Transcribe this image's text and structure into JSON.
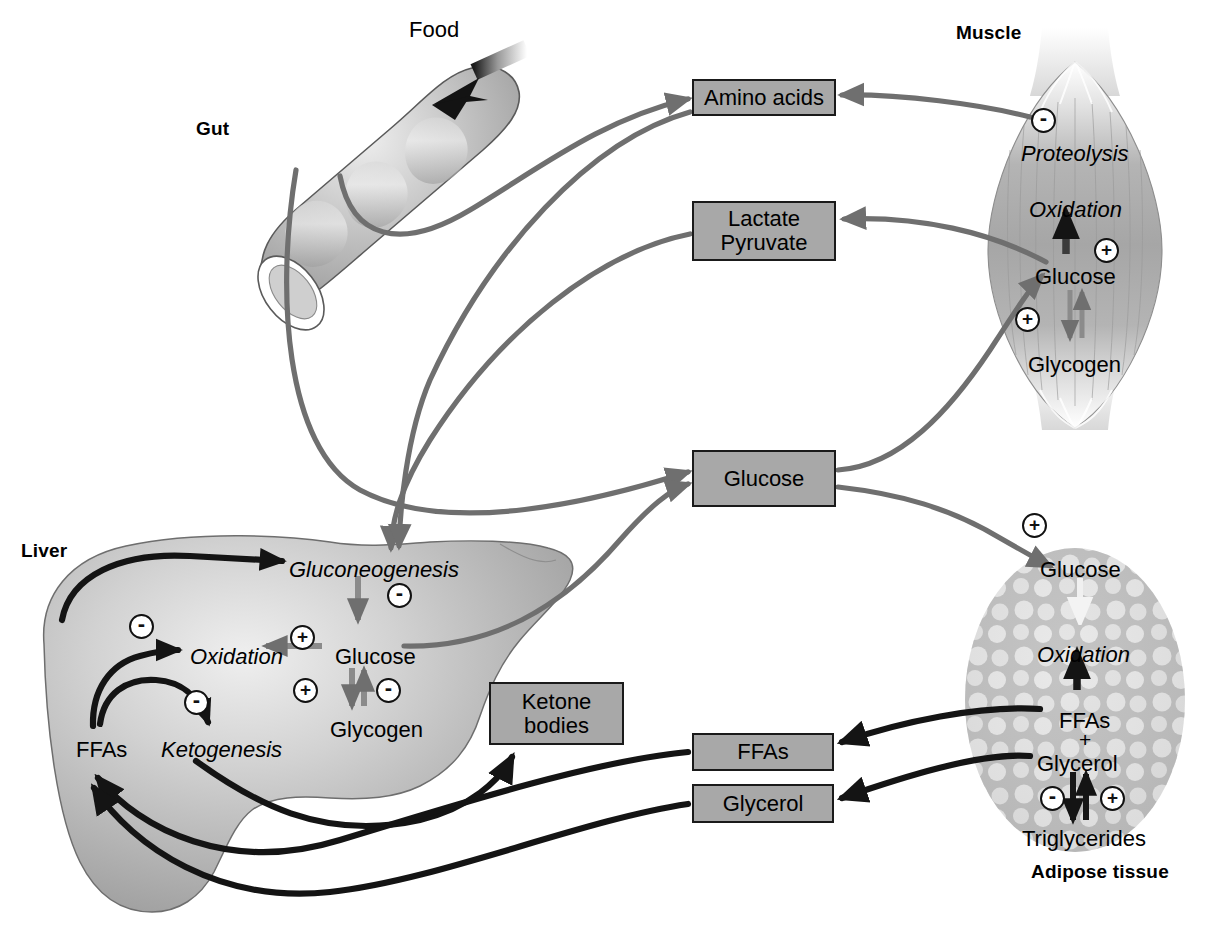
{
  "diagram": {
    "type": "physiology-flow-diagram",
    "background": "#ffffff"
  },
  "colors": {
    "box_fill": "#a8a8a8",
    "box_stroke": "#1a1a1a",
    "gray_arrow": "#6f6f6f",
    "black_arrow": "#141414",
    "organ_gray": "#b3b3b3",
    "text": "#000000"
  },
  "organs": {
    "gut": {
      "title": "Gut",
      "title_pos": [
        196,
        118
      ],
      "food_label": "Food",
      "food_label_pos": [
        409,
        18
      ]
    },
    "muscle": {
      "title": "Muscle",
      "title_pos": [
        956,
        22
      ],
      "items": [
        {
          "label": "Proteolysis",
          "style": "italic",
          "pos": [
            1021,
            142
          ]
        },
        {
          "label": "Oxidation",
          "style": "italic",
          "pos": [
            1029,
            198
          ]
        },
        {
          "label": "Glucose",
          "style": "plain",
          "pos": [
            1035,
            265
          ]
        },
        {
          "label": "Glycogen",
          "style": "plain",
          "pos": [
            1028,
            353
          ]
        }
      ],
      "signs": [
        {
          "sign": "-",
          "pos": [
            1031,
            108
          ],
          "target": "proteolysis"
        },
        {
          "sign": "+",
          "pos": [
            1094,
            238
          ],
          "target": "oxidation"
        },
        {
          "sign": "+",
          "pos": [
            1015,
            307
          ],
          "target": "glucose-uptake"
        }
      ]
    },
    "liver": {
      "title": "Liver",
      "title_pos": [
        21,
        540
      ],
      "items": [
        {
          "label": "Gluconeogenesis",
          "style": "italic",
          "pos": [
            289,
            558
          ]
        },
        {
          "label": "Oxidation",
          "style": "italic",
          "pos": [
            190,
            645
          ]
        },
        {
          "label": "Glucose",
          "style": "plain",
          "pos": [
            335,
            645
          ]
        },
        {
          "label": "Glycogen",
          "style": "plain",
          "pos": [
            330,
            718
          ]
        },
        {
          "label": "FFAs",
          "style": "plain",
          "pos": [
            76,
            738
          ]
        },
        {
          "label": "Ketogenesis",
          "style": "italic",
          "pos": [
            161,
            738
          ]
        }
      ],
      "signs": [
        {
          "sign": "-",
          "pos": [
            387,
            583
          ],
          "target": "gluconeogenesis-to-glucose"
        },
        {
          "sign": "+",
          "pos": [
            290,
            625
          ],
          "target": "glucose-to-oxidation"
        },
        {
          "sign": "-",
          "pos": [
            129,
            614
          ],
          "target": "ffa-to-oxidation"
        },
        {
          "sign": "-",
          "pos": [
            184,
            690
          ],
          "target": "ffa-to-ketogenesis"
        },
        {
          "sign": "+",
          "pos": [
            293,
            678
          ],
          "target": "glycogen-to-glucose"
        },
        {
          "sign": "-",
          "pos": [
            376,
            678
          ],
          "target": "glucose-to-glycogen"
        }
      ]
    },
    "adipose": {
      "title": "Adipose tissue",
      "title_pos": [
        1031,
        861
      ],
      "items": [
        {
          "label": "Glucose",
          "style": "plain",
          "pos": [
            1040,
            558
          ]
        },
        {
          "label": "Oxidation",
          "style": "italic",
          "pos": [
            1037,
            643
          ]
        },
        {
          "label": "FFAs",
          "style": "plain",
          "pos": [
            1059,
            709
          ]
        },
        {
          "label": "+",
          "style": "plain",
          "pos": [
            1079,
            731
          ]
        },
        {
          "label": "Glycerol",
          "style": "plain",
          "pos": [
            1037,
            754
          ]
        },
        {
          "label": "Triglycerides",
          "style": "plain",
          "pos": [
            1022,
            827
          ]
        }
      ],
      "signs": [
        {
          "sign": "+",
          "pos": [
            1022,
            513
          ],
          "target": "glucose-uptake"
        },
        {
          "sign": "-",
          "pos": [
            1050,
            788
          ],
          "target": "lipolysis-inhibit"
        },
        {
          "sign": "+",
          "pos": [
            1104,
            788
          ],
          "target": "lipogenesis"
        }
      ]
    }
  },
  "boxes": [
    {
      "id": "amino-acids",
      "lines": [
        "Amino acids"
      ],
      "x": 692,
      "y": 79,
      "w": 144,
      "h": 37
    },
    {
      "id": "lactate-pyruvate",
      "lines": [
        "Lactate",
        "Pyruvate"
      ],
      "x": 692,
      "y": 201,
      "w": 144,
      "h": 60
    },
    {
      "id": "glucose-blood",
      "lines": [
        "Glucose"
      ],
      "x": 692,
      "y": 450,
      "w": 144,
      "h": 57
    },
    {
      "id": "ketone-bodies",
      "lines": [
        "Ketone",
        "bodies"
      ],
      "x": 489,
      "y": 682,
      "w": 135,
      "h": 63
    },
    {
      "id": "ffas-blood",
      "lines": [
        "FFAs"
      ],
      "x": 692,
      "y": 733,
      "w": 142,
      "h": 38
    },
    {
      "id": "glycerol-blood",
      "lines": [
        "Glycerol"
      ],
      "x": 692,
      "y": 784,
      "w": 142,
      "h": 39
    }
  ],
  "flows": [
    {
      "from": "gut",
      "to": "amino-acids",
      "color": "gray"
    },
    {
      "from": "gut",
      "to": "gluconeogenesis",
      "color": "gray"
    },
    {
      "from": "gut",
      "to": "glucose-blood",
      "color": "gray"
    },
    {
      "from": "muscle-proteolysis",
      "to": "amino-acids",
      "color": "gray"
    },
    {
      "from": "muscle-glucose",
      "to": "lactate-pyruvate",
      "color": "gray"
    },
    {
      "from": "lactate-pyruvate",
      "to": "gluconeogenesis",
      "color": "gray"
    },
    {
      "from": "liver-glucose",
      "to": "glucose-blood",
      "color": "gray"
    },
    {
      "from": "glucose-blood",
      "to": "muscle-glucose",
      "color": "gray"
    },
    {
      "from": "glucose-blood",
      "to": "adipose-glucose",
      "color": "gray"
    },
    {
      "from": "adipose-ffas",
      "to": "ffas-blood",
      "color": "black"
    },
    {
      "from": "adipose-glycerol",
      "to": "glycerol-blood",
      "color": "black"
    },
    {
      "from": "ffas-blood",
      "to": "liver-ffas",
      "color": "black"
    },
    {
      "from": "glycerol-blood",
      "to": "liver-ffas",
      "color": "black"
    },
    {
      "from": "liver-ketogenesis",
      "to": "ketone-bodies",
      "color": "black"
    },
    {
      "from": "liver-ffas",
      "to": "gluconeogenesis",
      "color": "black"
    }
  ]
}
